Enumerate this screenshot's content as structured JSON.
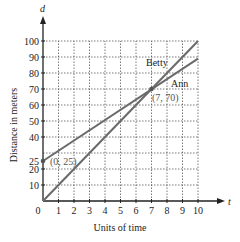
{
  "chart_data": {
    "type": "line",
    "title": "",
    "xlabel": "Units of time",
    "ylabel": "Distance in meters",
    "x_var": "t",
    "y_var": "d",
    "xlim": [
      0,
      10
    ],
    "ylim": [
      0,
      100
    ],
    "grid": true,
    "x_ticks": [
      "0",
      "1",
      "2",
      "3",
      "4",
      "5",
      "6",
      "7",
      "8",
      "9",
      "10"
    ],
    "y_ticks": [
      "10",
      "20",
      "25",
      "40",
      "50",
      "60",
      "70",
      "80",
      "90",
      "100"
    ],
    "series": [
      {
        "name": "Betty",
        "x": [
          0,
          10
        ],
        "values": [
          0,
          100
        ]
      },
      {
        "name": "Ann",
        "x": [
          0,
          10
        ],
        "values": [
          25,
          89
        ]
      }
    ],
    "annotations": [
      {
        "label": "(0, 25)",
        "x": 0,
        "y": 25
      },
      {
        "label": "(7, 70)",
        "x": 7,
        "y": 70
      }
    ]
  }
}
